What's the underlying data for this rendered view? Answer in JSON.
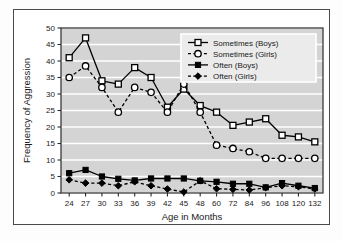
{
  "figure": {
    "background_color": "#ffffff",
    "frame_color": "#4a4a4a",
    "plot_background_color": "#d4d4d4",
    "gridline_color": "#ffffff"
  },
  "chart_data": {
    "type": "line",
    "title": "",
    "xlabel": "Age in Months",
    "ylabel": "Frequency of Aggression",
    "categories": [
      "24",
      "27",
      "30",
      "33",
      "36",
      "39",
      "42",
      "45",
      "48",
      "60",
      "72",
      "84",
      "96",
      "108",
      "120",
      "132"
    ],
    "xtick_labels": [
      "24",
      "27",
      "30",
      "33",
      "36",
      "39",
      "42",
      "45",
      "48",
      "60",
      "72",
      "84",
      "96",
      "108",
      "120",
      "132"
    ],
    "ytick_labels": [
      "0",
      "5",
      "10",
      "15",
      "20",
      "25",
      "30",
      "35",
      "40",
      "45",
      "50"
    ],
    "ylim": [
      0,
      50
    ],
    "ytick_step": 5,
    "grid": "horizontal",
    "legend_position": "top-right",
    "series": [
      {
        "name": "Sometimes (Boys)",
        "marker": "open-square",
        "line_style": "solid",
        "color": "#000000",
        "values": [
          41,
          47,
          34,
          33,
          38,
          35,
          26,
          31.5,
          26.5,
          24.5,
          20.5,
          21.5,
          22.5,
          17.5,
          17,
          15.5
        ]
      },
      {
        "name": "Sometimes (Girls)",
        "marker": "open-circle",
        "line_style": "dashed",
        "color": "#000000",
        "values": [
          35,
          38.5,
          32,
          24.5,
          32,
          30.5,
          24.5,
          33,
          24.5,
          14.5,
          13.5,
          12.5,
          10.5,
          10.5,
          10.5,
          10.5
        ]
      },
      {
        "name": "Often (Boys)",
        "marker": "filled-square",
        "line_style": "solid",
        "color": "#000000",
        "values": [
          6,
          7,
          5,
          4.3,
          3.8,
          4.4,
          4.4,
          4.4,
          3.7,
          3.4,
          2.8,
          2.8,
          1.7,
          3,
          2.2,
          1.5
        ]
      },
      {
        "name": "Often (Girls)",
        "marker": "filled-diamond",
        "line_style": "dashed",
        "color": "#000000",
        "values": [
          4,
          3,
          3,
          2.2,
          3.4,
          2.2,
          1.2,
          0.3,
          3.7,
          1.3,
          1.1,
          0.9,
          1.6,
          2.2,
          1.9,
          1.2
        ]
      }
    ]
  },
  "legend": {
    "items": [
      {
        "label": "Sometimes (Boys)"
      },
      {
        "label": "Sometimes (Girls)"
      },
      {
        "label": "Often (Boys)"
      },
      {
        "label": "Often (Girls)"
      }
    ]
  }
}
